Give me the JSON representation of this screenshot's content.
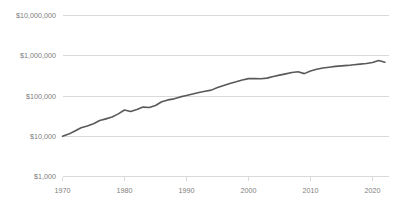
{
  "chart_data": {
    "type": "line",
    "title": "",
    "subtitle": "",
    "xlabel": "",
    "ylabel": "",
    "yscale": "log",
    "xlim": [
      1970,
      2022.5
    ],
    "ylim": [
      1000,
      10000000
    ],
    "grid": true,
    "legend": false,
    "legend_position": "none",
    "line_color": "#595959",
    "grid_color": "#d9d9d9",
    "text_color": "#808080",
    "background_color": "#ffffff",
    "y_ticks": [
      "$1,000",
      "$10,000",
      "$100,000",
      "$1,000,000",
      "$10,000,000"
    ],
    "y_tick_values": [
      1000,
      10000,
      100000,
      1000000,
      10000000
    ],
    "x_ticks": [
      "1970",
      "1980",
      "1990",
      "2000",
      "2010",
      "2020"
    ],
    "x_tick_values": [
      1970,
      1980,
      1990,
      2000,
      2010,
      2020
    ],
    "series": [
      {
        "name": "value",
        "x": [
          1970,
          1971,
          1972,
          1973,
          1974,
          1975,
          1976,
          1977,
          1978,
          1979,
          1980,
          1981,
          1982,
          1983,
          1984,
          1985,
          1986,
          1987,
          1988,
          1989,
          1990,
          1991,
          1992,
          1993,
          1994,
          1995,
          1996,
          1997,
          1998,
          1999,
          2000,
          2001,
          2002,
          2003,
          2004,
          2005,
          2006,
          2007,
          2008,
          2009,
          2010,
          2011,
          2012,
          2013,
          2014,
          2015,
          2016,
          2017,
          2018,
          2019,
          2020,
          2021,
          2022
        ],
        "values": [
          10000,
          11300,
          13500,
          16200,
          18000,
          20500,
          24500,
          27000,
          30000,
          36000,
          45000,
          41000,
          46000,
          53000,
          52000,
          58000,
          72000,
          80000,
          85000,
          95000,
          103000,
          112000,
          122000,
          131000,
          140000,
          162000,
          182000,
          205000,
          225000,
          250000,
          270000,
          272000,
          268000,
          278000,
          305000,
          330000,
          355000,
          385000,
          400000,
          360000,
          420000,
          460000,
          495000,
          520000,
          545000,
          560000,
          575000,
          600000,
          620000,
          640000,
          680000,
          760000,
          690000
        ]
      }
    ]
  },
  "axes": {
    "y_labels": [
      "$10,000,000",
      "$1,000,000",
      "$100,000",
      "$10,000",
      "$1,000"
    ],
    "x_labels": [
      "1970",
      "1980",
      "1990",
      "2000",
      "2010",
      "2020"
    ]
  }
}
